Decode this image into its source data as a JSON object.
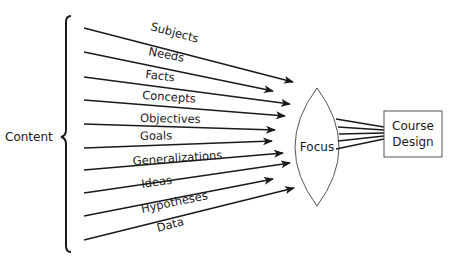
{
  "diagram": {
    "title": "",
    "group_label": "Content",
    "inputs": [
      {
        "label": "Subjects",
        "x1": 84,
        "y1": 28,
        "x2": 293,
        "y2": 82,
        "lx": 150,
        "ly": 30,
        "angle": 15
      },
      {
        "label": "Needs",
        "x1": 84,
        "y1": 52,
        "x2": 273,
        "y2": 91,
        "lx": 148,
        "ly": 55,
        "angle": 11
      },
      {
        "label": "Facts",
        "x1": 84,
        "y1": 77,
        "x2": 290,
        "y2": 104,
        "lx": 145,
        "ly": 78,
        "angle": 7
      },
      {
        "label": "Concepts",
        "x1": 84,
        "y1": 100,
        "x2": 285,
        "y2": 116,
        "lx": 142,
        "ly": 99,
        "angle": 4
      },
      {
        "label": "Objectives",
        "x1": 84,
        "y1": 124,
        "x2": 275,
        "y2": 130,
        "lx": 140,
        "ly": 122,
        "angle": 1
      },
      {
        "label": "Goals",
        "x1": 84,
        "y1": 148,
        "x2": 272,
        "y2": 141,
        "lx": 140,
        "ly": 140,
        "angle": -1
      },
      {
        "label": "Generalizations",
        "x1": 84,
        "y1": 170,
        "x2": 283,
        "y2": 153,
        "lx": 133,
        "ly": 165,
        "angle": -4
      },
      {
        "label": "Ideas",
        "x1": 84,
        "y1": 193,
        "x2": 290,
        "y2": 163,
        "lx": 142,
        "ly": 188,
        "angle": -8
      },
      {
        "label": "Hypotheses",
        "x1": 84,
        "y1": 216,
        "x2": 273,
        "y2": 179,
        "lx": 142,
        "ly": 213,
        "angle": -12
      },
      {
        "label": "Data",
        "x1": 84,
        "y1": 240,
        "x2": 294,
        "y2": 188,
        "lx": 158,
        "ly": 232,
        "angle": -15
      }
    ],
    "lens": {
      "label": "Focus",
      "cx": 317,
      "top": 88,
      "bottom": 206,
      "half_width": 22
    },
    "output": {
      "line1": "Course",
      "line2": "Design",
      "x": 384,
      "y": 111,
      "w": 58,
      "h": 46
    },
    "colors": {
      "stroke": "#1a1a1a",
      "lens_stroke": "#555555",
      "box_stroke": "#555555",
      "background": "#ffffff"
    }
  }
}
